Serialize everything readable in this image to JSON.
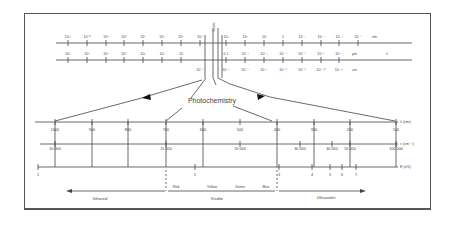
{
  "diagram": {
    "title": "Photochemistry",
    "top_scale_1": {
      "unit": "nm",
      "labels": [
        "10¹¹",
        "10¹⁰",
        "10⁹",
        "10⁸",
        "10⁷",
        "10⁶",
        "10⁵",
        "10⁴",
        "10³",
        "10²",
        "10",
        "1",
        "10⁻¹",
        "10⁻²",
        "10⁻³",
        "10⁻⁴"
      ]
    },
    "top_scale_2": {
      "unit": "µm",
      "extra_unit": "λ",
      "labels": [
        "10⁷",
        "10⁶",
        "10⁵",
        "10⁴",
        "10³",
        "10²",
        "10",
        "",
        "0.1",
        "10⁻²",
        "10⁻³",
        "10⁻⁴",
        "10⁻⁵",
        "10⁻⁶",
        "10⁻⁷"
      ],
      "sub_labels": [
        "10⁻⁴",
        "10⁻⁵",
        "10⁻⁶",
        "10⁻⁷",
        "10⁻⁸",
        "10⁻⁹",
        "10⁻¹⁰",
        "10⁻¹¹"
      ],
      "sub_unit": "cm"
    },
    "vertical_label": "Visible",
    "wavelength_axis": {
      "unit": "λ (nm)",
      "ticks": [
        "1000",
        "900",
        "800",
        "700",
        "600",
        "500",
        "400",
        "300",
        "200",
        "100"
      ]
    },
    "wavenumber_axis": {
      "unit": "ν (cm⁻¹)",
      "ticks": [
        "10 000",
        "15 000",
        "20 000",
        "30 000",
        "40 000",
        "50 000",
        "100 000"
      ]
    },
    "energy_axis": {
      "unit": "E (eV)",
      "ticks": [
        "1",
        "2",
        "3",
        "4",
        "5",
        "6",
        "7"
      ]
    },
    "colors": [
      "Red",
      "Yellow",
      "Green",
      "Blue"
    ],
    "regions": [
      "Infrared",
      "Visible",
      "Ultraviolet"
    ]
  }
}
